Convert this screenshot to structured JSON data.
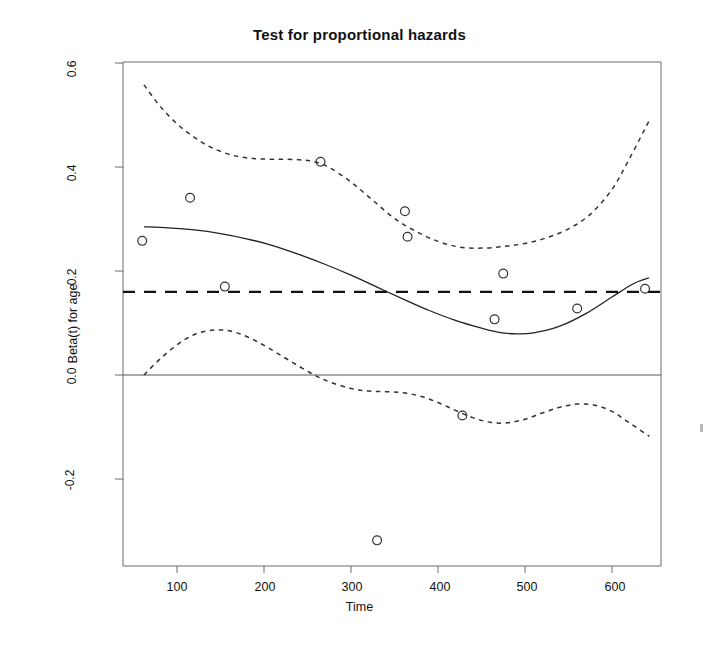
{
  "chart_data": {
    "type": "line",
    "title": "Test for proportional hazards",
    "xlabel": "Time",
    "ylabel": "Beta(t) for age",
    "xlim": [
      55,
      648
    ],
    "ylim": [
      -0.345,
      0.6
    ],
    "grid": false,
    "legend": null,
    "xticks": [
      100,
      200,
      300,
      400,
      500,
      600
    ],
    "xtick_labels": [
      "100",
      "200",
      "300",
      "400",
      "500",
      "600"
    ],
    "yticks": [
      -0.2,
      0.0,
      0.2,
      0.4,
      0.6
    ],
    "ytick_labels": [
      "-0.2",
      "0.0",
      "0.2",
      "0.4",
      "0.6"
    ],
    "reference_lines": [
      {
        "name": "zero-line",
        "y": 0.0,
        "style": "solid",
        "color": "#555555"
      },
      {
        "name": "global-beta-line",
        "y": 0.16,
        "style": "dashed",
        "color": "#111111"
      }
    ],
    "series": [
      {
        "name": "smoothed-beta",
        "style": "solid",
        "color": "#222222",
        "points": [
          [
            62,
            0.285
          ],
          [
            90,
            0.283
          ],
          [
            120,
            0.279
          ],
          [
            150,
            0.272
          ],
          [
            180,
            0.262
          ],
          [
            210,
            0.249
          ],
          [
            240,
            0.232
          ],
          [
            270,
            0.213
          ],
          [
            300,
            0.192
          ],
          [
            330,
            0.169
          ],
          [
            360,
            0.146
          ],
          [
            390,
            0.124
          ],
          [
            420,
            0.105
          ],
          [
            450,
            0.09
          ],
          [
            470,
            0.082
          ],
          [
            490,
            0.079
          ],
          [
            510,
            0.081
          ],
          [
            540,
            0.094
          ],
          [
            570,
            0.118
          ],
          [
            600,
            0.15
          ],
          [
            625,
            0.176
          ],
          [
            643,
            0.187
          ]
        ]
      },
      {
        "name": "upper-confidence-band",
        "style": "dotted",
        "color": "#333333",
        "points": [
          [
            62,
            0.558
          ],
          [
            80,
            0.518
          ],
          [
            100,
            0.483
          ],
          [
            120,
            0.457
          ],
          [
            140,
            0.437
          ],
          [
            165,
            0.422
          ],
          [
            190,
            0.416
          ],
          [
            215,
            0.415
          ],
          [
            240,
            0.414
          ],
          [
            258,
            0.41
          ],
          [
            275,
            0.399
          ],
          [
            300,
            0.371
          ],
          [
            325,
            0.336
          ],
          [
            350,
            0.301
          ],
          [
            375,
            0.276
          ],
          [
            400,
            0.257
          ],
          [
            425,
            0.246
          ],
          [
            450,
            0.244
          ],
          [
            475,
            0.247
          ],
          [
            500,
            0.253
          ],
          [
            525,
            0.264
          ],
          [
            550,
            0.281
          ],
          [
            575,
            0.309
          ],
          [
            600,
            0.357
          ],
          [
            620,
            0.416
          ],
          [
            643,
            0.49
          ]
        ]
      },
      {
        "name": "lower-confidence-band",
        "style": "dotted",
        "color": "#333333",
        "points": [
          [
            62,
            0.0
          ],
          [
            80,
            0.03
          ],
          [
            100,
            0.058
          ],
          [
            120,
            0.078
          ],
          [
            140,
            0.086
          ],
          [
            160,
            0.085
          ],
          [
            180,
            0.074
          ],
          [
            200,
            0.057
          ],
          [
            220,
            0.037
          ],
          [
            240,
            0.017
          ],
          [
            258,
            0.0
          ],
          [
            275,
            -0.013
          ],
          [
            300,
            -0.026
          ],
          [
            320,
            -0.031
          ],
          [
            340,
            -0.032
          ],
          [
            360,
            -0.034
          ],
          [
            380,
            -0.041
          ],
          [
            400,
            -0.053
          ],
          [
            420,
            -0.068
          ],
          [
            440,
            -0.082
          ],
          [
            460,
            -0.091
          ],
          [
            480,
            -0.092
          ],
          [
            500,
            -0.085
          ],
          [
            520,
            -0.073
          ],
          [
            540,
            -0.062
          ],
          [
            560,
            -0.056
          ],
          [
            580,
            -0.058
          ],
          [
            600,
            -0.07
          ],
          [
            620,
            -0.092
          ],
          [
            643,
            -0.118
          ]
        ]
      }
    ],
    "scatter": {
      "name": "schoenfeld-residuals",
      "marker": "open-circle",
      "color": "#333333",
      "points": [
        [
          60,
          0.258
        ],
        [
          115,
          0.341
        ],
        [
          155,
          0.17
        ],
        [
          265,
          0.41
        ],
        [
          330,
          -0.318
        ],
        [
          362,
          0.315
        ],
        [
          365,
          0.266
        ],
        [
          428,
          -0.078
        ],
        [
          465,
          0.107
        ],
        [
          475,
          0.195
        ],
        [
          560,
          0.128
        ],
        [
          638,
          0.166
        ]
      ]
    }
  }
}
